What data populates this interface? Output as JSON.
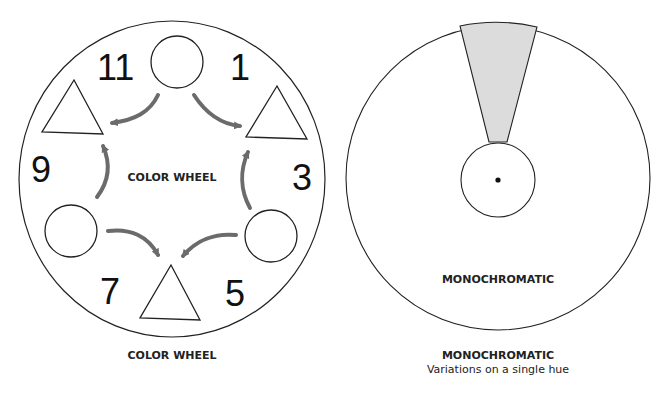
{
  "color_wheel": {
    "center_label": "COLOR WHEEL",
    "caption": "COLOR WHEEL",
    "positions": [
      {
        "number": "11",
        "shape": "triangle"
      },
      {
        "number": "1",
        "shape": "triangle"
      },
      {
        "number": "3",
        "shape": "circle"
      },
      {
        "number": "5",
        "shape": "triangle"
      },
      {
        "number": "7",
        "shape": "circle"
      },
      {
        "number": "9",
        "shape": "triangle"
      }
    ],
    "labels": {
      "n11": "11",
      "n1": "1",
      "n3": "3",
      "n5": "5",
      "n7": "7",
      "n9": "9"
    },
    "arrow_color": "#6b6b6b"
  },
  "monochromatic": {
    "center_label": "MONOCHROMATIC",
    "caption_title": "MONOCHROMATIC",
    "caption_subtitle": "Variations on a single hue",
    "wedge_color": "#dcdcdc"
  }
}
